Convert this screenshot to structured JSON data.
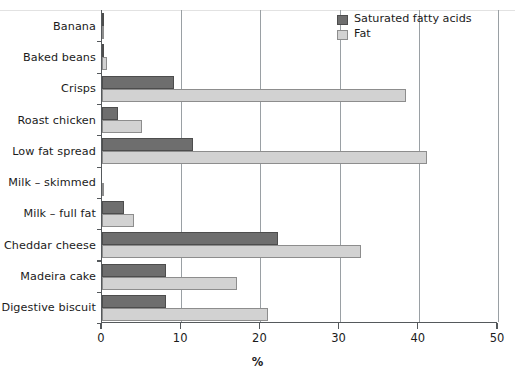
{
  "chart_data": {
    "type": "bar",
    "orientation": "horizontal",
    "title": "",
    "xlabel": "%",
    "ylabel": "",
    "xlim": [
      0,
      50
    ],
    "xticks": [
      0,
      10,
      20,
      30,
      40,
      50
    ],
    "xtick_labels": [
      "0",
      "10",
      "20",
      "30",
      "40",
      "50"
    ],
    "grid": "vertical",
    "legend_position": "top-right",
    "categories": [
      "Banana",
      "Baked beans",
      "Crisps",
      "Roast chicken",
      "Low fat spread",
      "Milk – skimmed",
      "Milk – full fat",
      "Cheddar cheese",
      "Madeira cake",
      "Digestive biscuit"
    ],
    "series": [
      {
        "name": "Saturated fatty acids",
        "color": "#6e6e6e",
        "values": [
          0.2,
          0.1,
          9.1,
          2.0,
          11.5,
          0.0,
          2.8,
          22.2,
          8.1,
          8.1
        ]
      },
      {
        "name": "Fat",
        "color": "#d2d2d2",
        "values": [
          0.3,
          0.6,
          38.4,
          5.0,
          41.0,
          0.1,
          4.0,
          32.7,
          17.0,
          21.0
        ]
      }
    ]
  },
  "legend": {
    "items": [
      {
        "label": "Saturated fatty acids",
        "swatch": "sat"
      },
      {
        "label": "Fat",
        "swatch": "fat"
      }
    ]
  },
  "axis": {
    "x_title": "%"
  }
}
